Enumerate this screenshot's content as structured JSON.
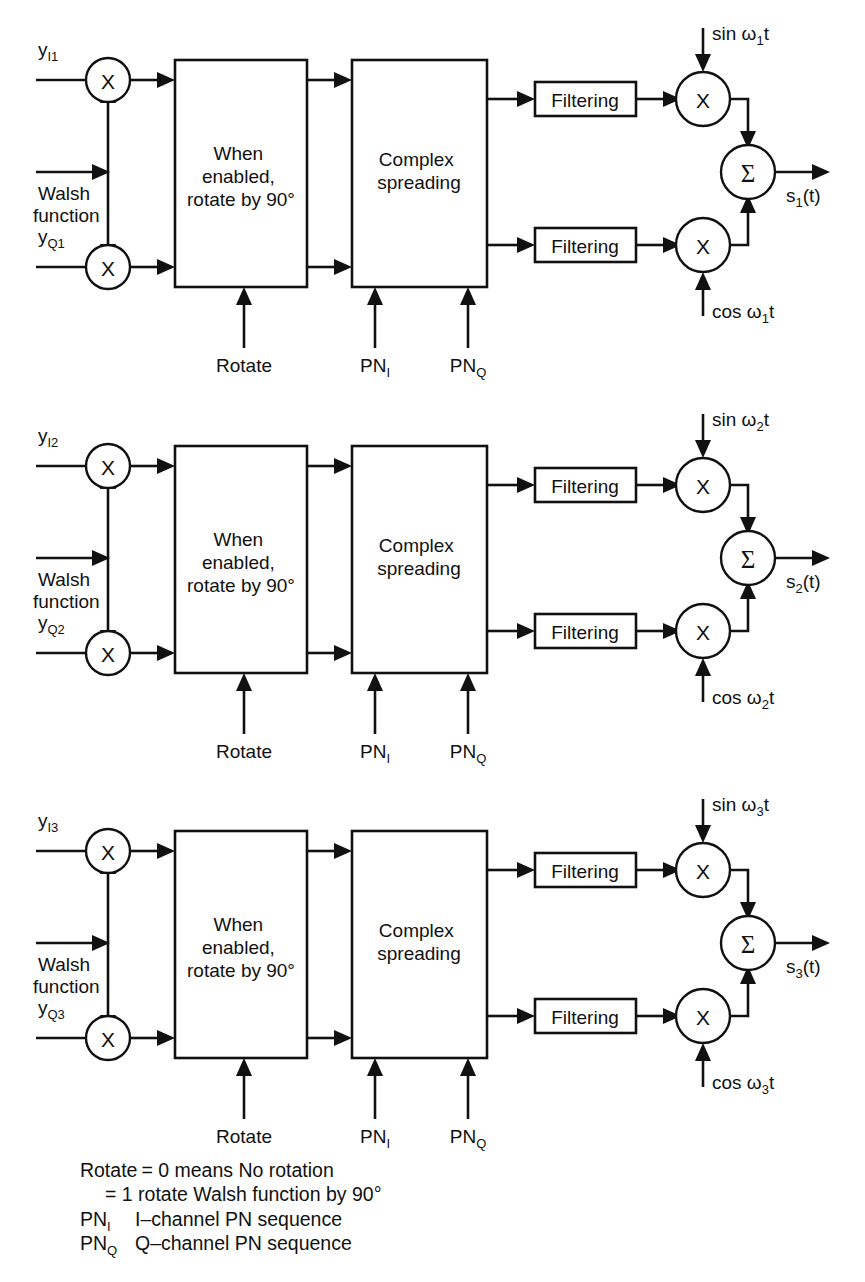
{
  "figure": {
    "ink_color": "#111111",
    "background_color": "#ffffff"
  },
  "shared_labels": {
    "multiplier_glyph": "X",
    "summer_glyph": "Σ",
    "walsh_line1": "Walsh",
    "walsh_line2": "function",
    "rotate_box_line1": "When",
    "rotate_box_line2": "enabled,",
    "rotate_box_line3": "rotate by 90°",
    "spread_box_line1": "Complex",
    "spread_box_line2": "spreading",
    "filtering_label": "Filtering",
    "rotate_ctrl_label": "Rotate",
    "pn_i_label": "PN",
    "pn_i_sub": "I",
    "pn_q_label": "PN",
    "pn_q_sub": "Q"
  },
  "channels": [
    {
      "index": "1",
      "in_i_base": "y",
      "in_i_sub": "I1",
      "in_q_base": "y",
      "in_q_sub": "Q1",
      "carrier_sin": "sin ω",
      "carrier_sin_sub": "1",
      "carrier_sin_tail": "t",
      "carrier_cos": "cos ω",
      "carrier_cos_sub": "1",
      "carrier_cos_tail": "t",
      "output_base": "s",
      "output_sub": "1",
      "output_tail": "(t)"
    },
    {
      "index": "2",
      "in_i_base": "y",
      "in_i_sub": "I2",
      "in_q_base": "y",
      "in_q_sub": "Q2",
      "carrier_sin": "sin ω",
      "carrier_sin_sub": "2",
      "carrier_sin_tail": "t",
      "carrier_cos": "cos ω",
      "carrier_cos_sub": "2",
      "carrier_cos_tail": "t",
      "output_base": "s",
      "output_sub": "2",
      "output_tail": "(t)"
    },
    {
      "index": "3",
      "in_i_base": "y",
      "in_i_sub": "I3",
      "in_q_base": "y",
      "in_q_sub": "Q3",
      "carrier_sin": "sin ω",
      "carrier_sin_sub": "3",
      "carrier_sin_tail": "t",
      "carrier_cos": "cos ω",
      "carrier_cos_sub": "3",
      "carrier_cos_tail": "t",
      "output_base": "s",
      "output_sub": "3",
      "output_tail": "(t)"
    }
  ],
  "legend": {
    "line1_head": "Rotate",
    "line1_eq": "= 0 means No rotation",
    "line2_eq": "= 1 rotate Walsh function by 90°",
    "line3_term_base": "PN",
    "line3_term_sub": "I",
    "line3_desc": "I–channel PN sequence",
    "line4_term_base": "PN",
    "line4_term_sub": "Q",
    "line4_desc": "Q–channel PN sequence"
  }
}
